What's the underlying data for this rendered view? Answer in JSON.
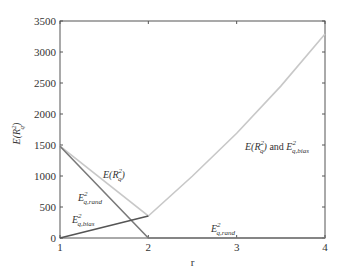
{
  "chart_data": {
    "type": "line",
    "title": "",
    "xlabel": "r",
    "ylabel": "E(R_q^2)",
    "xlim": [
      1,
      4
    ],
    "ylim": [
      0,
      3500
    ],
    "xticks": [
      "1",
      "2",
      "3",
      "4"
    ],
    "yticks": [
      "0",
      "500",
      "1000",
      "1500",
      "2000",
      "2500",
      "3000",
      "3500"
    ],
    "grid": false,
    "legend": "none (inline annotations)",
    "series": [
      {
        "name": "E(R_q^2)",
        "color": "#c8c8c8",
        "x": [
          1,
          2,
          2.5,
          3,
          3.5,
          4
        ],
        "y": [
          1480,
          355,
          1000,
          1690,
          2450,
          3290
        ]
      },
      {
        "name": "E_q,rand^2",
        "color": "#7a7a7a",
        "x": [
          1,
          2,
          3,
          4
        ],
        "y": [
          1480,
          0,
          0,
          0
        ]
      },
      {
        "name": "E_q,bias^2",
        "color": "#555555",
        "x": [
          1,
          2
        ],
        "y": [
          0,
          355
        ]
      }
    ],
    "annotations": [
      {
        "text": "E(R_q^2)",
        "x": 1.8,
        "y": 1150
      },
      {
        "text": "E_q,rand^2",
        "x": 1.25,
        "y": 850
      },
      {
        "text": "E_q,bias^2",
        "x": 1.1,
        "y": 370
      },
      {
        "text": "E(R_q^2) and E_q,bias^2",
        "x": 3.2,
        "y": 1400
      },
      {
        "text": "E_q,rand^2",
        "x": 2.85,
        "y": 80
      }
    ]
  },
  "labels": {
    "ylabel_main": "E(R",
    "ylabel_sub": "q",
    "ylabel_sup": "2",
    "ylabel_close": ")",
    "xlabel": "r",
    "ann_e": "E(R",
    "ann_q": "q",
    "ann_2": "2",
    "ann_close": ")",
    "ann_and": " and ",
    "E": "E",
    "rand": "q,rand",
    "bias": "q,bias"
  }
}
